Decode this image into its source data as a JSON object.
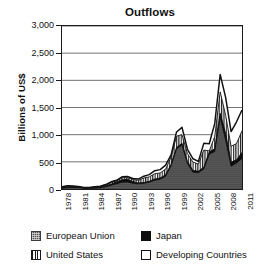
{
  "chart_data": {
    "type": "area",
    "stacked": true,
    "title": "Outflows",
    "xlabel": "",
    "ylabel": "Billions of US$",
    "ylim": [
      0,
      3000
    ],
    "yticks": [
      "0",
      "500",
      "1,000",
      "1,500",
      "2,000",
      "2,500",
      "3,000"
    ],
    "ytick_values": [
      0,
      500,
      1000,
      1500,
      2000,
      2500,
      3000
    ],
    "xlim": [
      1978,
      2011
    ],
    "xtick_labels": [
      "1978",
      "1981",
      "1984",
      "1987",
      "1990",
      "1993",
      "1996",
      "1999",
      "2002",
      "2005",
      "2008",
      "2011"
    ],
    "xtick_values": [
      1978,
      1981,
      1984,
      1987,
      1990,
      1993,
      1996,
      1999,
      2002,
      2005,
      2008,
      2011
    ],
    "x": [
      1978,
      1979,
      1980,
      1981,
      1982,
      1983,
      1984,
      1985,
      1986,
      1987,
      1988,
      1989,
      1990,
      1991,
      1992,
      1993,
      1994,
      1995,
      1996,
      1997,
      1998,
      1999,
      2000,
      2001,
      2002,
      2003,
      2004,
      2005,
      2006,
      2007,
      2008,
      2009,
      2010,
      2011
    ],
    "grid": "horizontal",
    "legend_position": "bottom",
    "series": [
      {
        "name": "European Union",
        "fill": "#595959",
        "values": [
          16,
          26,
          29,
          28,
          16,
          16,
          18,
          25,
          42,
          70,
          96,
          125,
          130,
          105,
          95,
          105,
          125,
          160,
          180,
          235,
          430,
          740,
          810,
          470,
          310,
          300,
          370,
          640,
          690,
          1320,
          900,
          420,
          480,
          560
        ]
      },
      {
        "name": "Japan",
        "fill": "#0d0d0d",
        "values": [
          5,
          5,
          2,
          5,
          5,
          4,
          6,
          6,
          14,
          20,
          34,
          44,
          48,
          31,
          17,
          14,
          18,
          23,
          23,
          26,
          24,
          23,
          32,
          38,
          32,
          29,
          31,
          46,
          50,
          74,
          128,
          75,
          57,
          114
        ]
      },
      {
        "name": "United States",
        "fill": "#ffffff",
        "hatch": "vertical",
        "values": [
          16,
          25,
          19,
          9,
          4,
          6,
          12,
          14,
          18,
          32,
          17,
          38,
          31,
          37,
          48,
          84,
          80,
          99,
          92,
          105,
          132,
          210,
          159,
          142,
          154,
          130,
          316,
          15,
          225,
          394,
          330,
          290,
          300,
          397
        ]
      },
      {
        "name": "Developing Countries",
        "fill": "#ffffff",
        "values": [
          2,
          3,
          4,
          5,
          4,
          4,
          5,
          6,
          8,
          10,
          14,
          17,
          20,
          19,
          22,
          33,
          41,
          55,
          62,
          73,
          42,
          77,
          134,
          81,
          61,
          49,
          123,
          133,
          238,
          321,
          328,
          271,
          400,
          384
        ]
      }
    ],
    "totals": [
      39,
      59,
      54,
      47,
      29,
      30,
      41,
      51,
      82,
      132,
      161,
      224,
      229,
      192,
      182,
      236,
      264,
      337,
      357,
      439,
      628,
      1050,
      1135,
      731,
      557,
      508,
      840,
      834,
      1203,
      2109,
      1686,
      1056,
      1237,
      1455
    ]
  },
  "legend": {
    "items": [
      {
        "label": "European Union",
        "swatch": "eu-swatch"
      },
      {
        "label": "Japan",
        "swatch": "japan-swatch"
      },
      {
        "label": "United States",
        "swatch": "united-states-swatch"
      },
      {
        "label": "Developing Countries",
        "swatch": "developing-countries-swatch"
      }
    ]
  }
}
